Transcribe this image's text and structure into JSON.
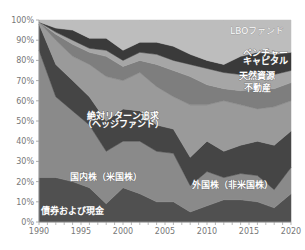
{
  "chart_data": {
    "type": "area",
    "stacked": true,
    "title": "",
    "xlabel": "",
    "ylabel": "",
    "x": [
      1990,
      1992,
      1994,
      1996,
      1998,
      2000,
      2002,
      2004,
      2006,
      2008,
      2010,
      2012,
      2014,
      2016,
      2018,
      2020
    ],
    "xlim": [
      1990,
      2020
    ],
    "ylim": [
      0,
      100
    ],
    "x_ticks": [
      "1990",
      "1995",
      "2000",
      "2005",
      "2010",
      "2015",
      "2020"
    ],
    "y_ticks": [
      "0%",
      "10%",
      "20%",
      "30%",
      "40%",
      "50%",
      "60%",
      "70%",
      "80%",
      "90%",
      "100%"
    ],
    "grid": false,
    "legend": "inline-labels",
    "cumulative_top_percent": {
      "bonds_cash": [
        22,
        22,
        20,
        17,
        9,
        17,
        14,
        10,
        10,
        5,
        8,
        11,
        11,
        10,
        7,
        14
      ],
      "us_equity": [
        85,
        62,
        55,
        48,
        35,
        40,
        40,
        35,
        34,
        18,
        25,
        22,
        24,
        23,
        16,
        27
      ],
      "foreign_equity": [
        98,
        78,
        70,
        62,
        50,
        56,
        55,
        48,
        46,
        32,
        40,
        35,
        38,
        40,
        38,
        45
      ],
      "absolute_return": [
        99,
        90,
        82,
        78,
        72,
        70,
        74,
        67,
        62,
        58,
        58,
        60,
        58,
        56,
        57,
        60
      ],
      "real_estate": [
        99,
        93,
        88,
        84,
        82,
        77,
        80,
        78,
        75,
        72,
        68,
        66,
        65,
        66,
        66,
        69
      ],
      "natural_resources": [
        99,
        94,
        90,
        86,
        85,
        80,
        84,
        83,
        80,
        78,
        76,
        74,
        73,
        74,
        73,
        75
      ],
      "venture_capital": [
        99,
        96,
        95,
        91,
        91,
        85,
        89,
        89,
        87,
        83,
        80,
        78,
        82,
        84,
        83,
        84
      ],
      "lbo": [
        100,
        100,
        100,
        100,
        100,
        100,
        100,
        100,
        100,
        100,
        100,
        100,
        100,
        100,
        100,
        100
      ]
    },
    "series": [
      {
        "key": "bonds_cash",
        "name": "債券および現金",
        "color": "#505050",
        "values": [
          22,
          22,
          20,
          17,
          9,
          17,
          14,
          10,
          10,
          5,
          8,
          11,
          11,
          10,
          7,
          14
        ]
      },
      {
        "key": "us_equity",
        "name": "国内株（米国株）",
        "color": "#8a8a8a",
        "values": [
          63,
          40,
          35,
          31,
          26,
          23,
          26,
          25,
          24,
          13,
          17,
          11,
          13,
          13,
          9,
          13
        ]
      },
      {
        "key": "foreign_equity",
        "name": "外国株（非米国株）",
        "color": "#454545",
        "values": [
          13,
          16,
          15,
          14,
          15,
          16,
          15,
          13,
          12,
          14,
          15,
          13,
          14,
          17,
          22,
          18
        ]
      },
      {
        "key": "absolute_return",
        "name": "絶対リターン追求（ヘッジファンド）",
        "color": "#9a9a9a",
        "values": [
          1,
          12,
          12,
          16,
          22,
          14,
          19,
          19,
          16,
          26,
          18,
          25,
          20,
          16,
          19,
          15
        ]
      },
      {
        "key": "real_estate",
        "name": "不動産",
        "color": "#7e7e7e",
        "values": [
          0,
          3,
          6,
          6,
          10,
          7,
          6,
          11,
          13,
          14,
          10,
          6,
          7,
          10,
          9,
          9
        ]
      },
      {
        "key": "natural_resources",
        "name": "天然資源",
        "color": "#a6a6a6",
        "values": [
          0,
          1,
          2,
          2,
          3,
          3,
          4,
          5,
          5,
          6,
          8,
          8,
          8,
          8,
          7,
          6
        ]
      },
      {
        "key": "venture_capital",
        "name": "ベンチャーキャピタル",
        "color": "#3a3a3a",
        "values": [
          0,
          2,
          5,
          5,
          6,
          5,
          5,
          6,
          7,
          5,
          4,
          4,
          9,
          10,
          10,
          9
        ]
      },
      {
        "key": "lbo",
        "name": "LBOファンド",
        "color": "#bdbdbd",
        "values": [
          1,
          4,
          5,
          9,
          9,
          15,
          11,
          11,
          13,
          17,
          20,
          22,
          18,
          16,
          17,
          16
        ]
      }
    ],
    "annotations": [
      {
        "text": "LBOファンド",
        "x": 2016,
        "y": 93
      },
      {
        "text": "ベンチャー",
        "x": 2017,
        "y": 82
      },
      {
        "text": "キャピタル",
        "x": 2017,
        "y": 78
      },
      {
        "text": "天然資源",
        "x": 2016,
        "y": 71
      },
      {
        "text": "不動産",
        "x": 2016,
        "y": 65
      },
      {
        "text": "絶対リターン追求",
        "x": 2000,
        "y": 51
      },
      {
        "text": "（ヘッジファンド）",
        "x": 2000,
        "y": 47
      },
      {
        "text": "国内株（米国株）",
        "x": 1998,
        "y": 21
      },
      {
        "text": "外国株（非米国株）",
        "x": 2013,
        "y": 17
      },
      {
        "text": "債券および現金",
        "x": 1994,
        "y": 4
      }
    ]
  }
}
